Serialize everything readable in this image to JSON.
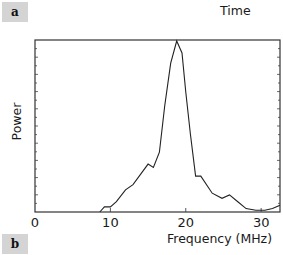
{
  "panels": {
    "top_label": "a",
    "bottom_label": "b"
  },
  "header": {
    "time_label": "Time"
  },
  "chart_data": {
    "type": "line",
    "title": "",
    "xlabel": "Frequency (MHz)",
    "ylabel": "Power",
    "xlim": [
      0,
      32.5
    ],
    "ylim": [
      0,
      1
    ],
    "x_ticks": [
      0,
      10,
      20,
      30
    ],
    "x_tick_labels": [
      "0",
      "10",
      "20",
      "30"
    ],
    "y_tick_labels": [],
    "grid": false,
    "legend": null,
    "series": [
      {
        "name": "Power spectrum",
        "x": [
          8.6,
          9.2,
          10.0,
          10.8,
          12.0,
          13.0,
          14.0,
          15.0,
          15.7,
          16.5,
          17.2,
          18.0,
          18.8,
          19.5,
          20.0,
          20.6,
          21.3,
          22.0,
          23.5,
          24.8,
          25.8,
          26.9,
          28.0,
          29.3,
          30.5,
          31.5,
          32.5
        ],
        "y": [
          0.0,
          0.03,
          0.03,
          0.06,
          0.13,
          0.16,
          0.22,
          0.28,
          0.26,
          0.35,
          0.62,
          0.87,
          1.0,
          0.93,
          0.7,
          0.46,
          0.21,
          0.21,
          0.11,
          0.08,
          0.1,
          0.06,
          0.02,
          0.01,
          0.01,
          0.02,
          0.04
        ]
      }
    ]
  }
}
